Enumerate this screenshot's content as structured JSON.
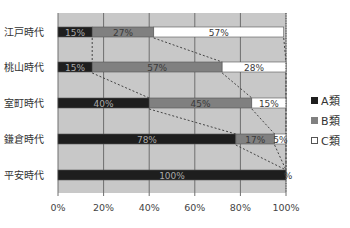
{
  "chart_data": {
    "type": "bar",
    "orientation": "horizontal",
    "stacked": "percent",
    "title": "",
    "xlabel": "",
    "ylabel": "",
    "categories": [
      "江戸時代",
      "桃山時代",
      "室町時代",
      "鎌倉時代",
      "平安時代"
    ],
    "series": [
      {
        "name": "A類",
        "color": "#1e1e1e",
        "values": [
          15,
          15,
          40,
          78,
          100
        ]
      },
      {
        "name": "B類",
        "color": "#808080",
        "values": [
          27,
          57,
          45,
          17,
          0
        ]
      },
      {
        "name": "C類",
        "color": "#ffffff",
        "values": [
          57,
          28,
          15,
          5,
          0
        ]
      }
    ],
    "data_labels": [
      [
        "15%",
        "27%",
        "57%"
      ],
      [
        "15%",
        "57%",
        "28%"
      ],
      [
        "40%",
        "45%",
        "15%"
      ],
      [
        "78%",
        "17%",
        "5%"
      ],
      [
        "100%",
        "",
        "%"
      ]
    ],
    "xticks": [
      "0%",
      "20%",
      "40%",
      "60%",
      "80%",
      "100%"
    ],
    "xlim": [
      0,
      100
    ],
    "grid": true,
    "series_lines": true,
    "plot_background": "#c8c8c8",
    "legend_position": "right"
  },
  "legend": {
    "items": [
      {
        "label": "A類",
        "color": "#1e1e1e"
      },
      {
        "label": "B類",
        "color": "#808080"
      },
      {
        "label": "C類",
        "color": "#ffffff"
      }
    ]
  }
}
